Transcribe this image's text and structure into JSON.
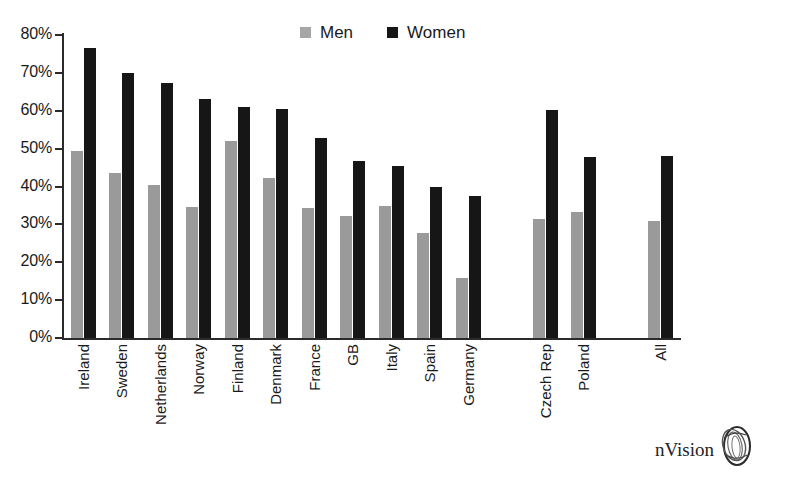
{
  "chart_data": {
    "type": "bar",
    "title": "",
    "subtitle": "",
    "xlabel": "",
    "ylabel": "",
    "ylim": [
      0,
      80
    ],
    "ytick_labels": [
      "80%",
      "70%",
      "60%",
      "50%",
      "40%",
      "30%",
      "20%",
      "10%",
      "0%"
    ],
    "ytick_values": [
      80,
      70,
      60,
      50,
      40,
      30,
      20,
      10,
      0
    ],
    "grid": false,
    "legend_position": "top-center",
    "categories": [
      "Ireland",
      "Sweden",
      "Netherlands",
      "Norway",
      "Finland",
      "Denmark",
      "France",
      "GB",
      "Italy",
      "Spain",
      "Germany",
      "",
      "Czech Rep",
      "Poland",
      "",
      "All"
    ],
    "series": [
      {
        "name": "Men",
        "color": "#9a9a9a",
        "values": [
          49.5,
          43.5,
          40.5,
          34.7,
          52.0,
          42.2,
          34.3,
          32.3,
          34.8,
          27.7,
          15.8,
          null,
          31.5,
          33.2,
          null,
          31.0
        ]
      },
      {
        "name": "Women",
        "color": "#161616",
        "values": [
          76.6,
          70.0,
          67.3,
          63.0,
          61.0,
          60.5,
          52.8,
          46.7,
          45.3,
          40.0,
          37.5,
          null,
          60.2,
          47.9,
          null,
          48.0
        ]
      }
    ]
  },
  "legend": {
    "items": [
      {
        "label": "Men",
        "swatch": "men-swatch-icon"
      },
      {
        "label": "Women",
        "swatch": "women-swatch-icon"
      }
    ]
  },
  "logo": {
    "text": "nVision",
    "mark": "nvision-swirl-icon"
  }
}
